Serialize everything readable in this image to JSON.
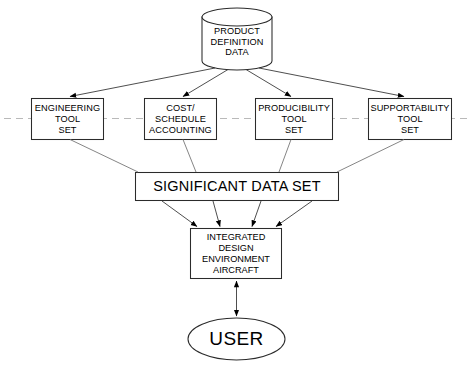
{
  "diagram": {
    "title_present": false,
    "background_color": "#ffffff",
    "stroke_color": "#000000",
    "dashed_line_color": "#b9b9b9",
    "nodes": {
      "database": {
        "shape": "cylinder",
        "lines": [
          "PRODUCT",
          "DEFINITION",
          "DATA"
        ]
      },
      "engineering_tool_set": {
        "shape": "rectangle",
        "lines": [
          "ENGINEERING",
          "TOOL",
          "SET"
        ]
      },
      "cost_schedule_accounting": {
        "shape": "rectangle",
        "lines": [
          "COST/",
          "SCHEDULE",
          "ACCOUNTING"
        ]
      },
      "producibility_tool_set": {
        "shape": "rectangle",
        "lines": [
          "PRODUCIBILITY",
          "TOOL",
          "SET"
        ]
      },
      "supportability_tool_set": {
        "shape": "rectangle",
        "lines": [
          "SUPPORTABILITY",
          "TOOL",
          "SET"
        ]
      },
      "significant_data_set": {
        "shape": "rectangle",
        "lines": [
          "SIGNIFICANT DATA SET"
        ]
      },
      "integrated_design_environment": {
        "shape": "rectangle",
        "lines": [
          "INTEGRATED",
          "DESIGN",
          "ENVIRONMENT",
          "AIRCRAFT"
        ]
      },
      "user": {
        "shape": "ellipse",
        "lines": [
          "USER"
        ]
      }
    },
    "edges": [
      {
        "from": "database",
        "to": "engineering_tool_set",
        "arrow": "single"
      },
      {
        "from": "database",
        "to": "cost_schedule_accounting",
        "arrow": "single"
      },
      {
        "from": "database",
        "to": "producibility_tool_set",
        "arrow": "single"
      },
      {
        "from": "database",
        "to": "supportability_tool_set",
        "arrow": "single"
      },
      {
        "from": "engineering_tool_set",
        "to": "significant_data_set",
        "arrow": "none"
      },
      {
        "from": "cost_schedule_accounting",
        "to": "significant_data_set",
        "arrow": "none"
      },
      {
        "from": "producibility_tool_set",
        "to": "significant_data_set",
        "arrow": "none"
      },
      {
        "from": "supportability_tool_set",
        "to": "significant_data_set",
        "arrow": "none"
      },
      {
        "from": "significant_data_set",
        "to": "integrated_design_environment",
        "arrow": "single"
      },
      {
        "from": "integrated_design_environment",
        "to": "user",
        "arrow": "double"
      }
    ]
  }
}
